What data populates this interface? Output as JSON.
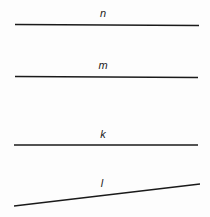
{
  "diagram": {
    "type": "lines",
    "background": "#ffffff",
    "line_color": "#1a1a1a",
    "lines": [
      {
        "label": "n",
        "x1": 15,
        "y1": 24.5,
        "x2": 199,
        "y2": 25.5,
        "label_x": 103,
        "label_y": 17
      },
      {
        "label": "m",
        "x1": 15,
        "y1": 76.5,
        "x2": 198,
        "y2": 77.5,
        "label_x": 103,
        "label_y": 69
      },
      {
        "label": "k",
        "x1": 14,
        "y1": 145,
        "x2": 198,
        "y2": 145,
        "label_x": 103,
        "label_y": 138
      },
      {
        "label": "l",
        "x1": 14,
        "y1": 206,
        "x2": 200,
        "y2": 184,
        "label_x": 102,
        "label_y": 187
      }
    ]
  }
}
